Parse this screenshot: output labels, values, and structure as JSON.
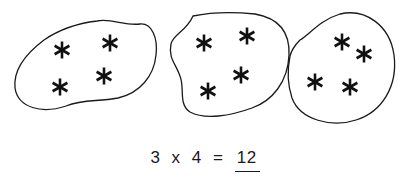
{
  "diagram": {
    "groups": [
      {
        "id": "group-1",
        "item_count": 4,
        "item_symbol": "*",
        "item_positions": [
          [
            62,
            50
          ],
          [
            110,
            43
          ],
          [
            60,
            87
          ],
          [
            104,
            76
          ]
        ]
      },
      {
        "id": "group-2",
        "item_count": 4,
        "item_symbol": "*",
        "item_positions": [
          [
            204,
            43
          ],
          [
            247,
            36
          ],
          [
            208,
            91
          ],
          [
            241,
            75
          ]
        ]
      },
      {
        "id": "group-3",
        "item_count": 4,
        "item_symbol": "*",
        "item_positions": [
          [
            342,
            42
          ],
          [
            364,
            54
          ],
          [
            315,
            82
          ],
          [
            350,
            87
          ]
        ]
      }
    ],
    "equation": {
      "left": "3",
      "operator": "x",
      "right": "4",
      "equals": "=",
      "answer": "12"
    }
  }
}
